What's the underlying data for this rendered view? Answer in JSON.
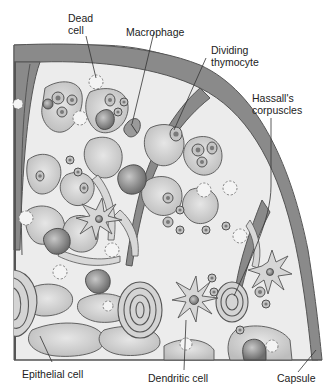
{
  "figure": {
    "colors": {
      "capsule": "#8a8a8a",
      "capsule_outline": "#555555",
      "background_tissue": "#ececec",
      "cell_fill": "#cfcfcf",
      "cell_outline": "#555555",
      "nucleus": "#8f8f8f",
      "dead_cell_outline": "#777777",
      "leader_line": "#333333",
      "label_text": "#222222"
    }
  },
  "labels": {
    "dead_cell": [
      "Dead",
      "cell"
    ],
    "macrophage": [
      "Macrophage"
    ],
    "dividing_thymocyte": [
      "Dividing",
      "thymocyte"
    ],
    "hassalls_corpuscles": [
      "Hassall's",
      "corpuscles"
    ],
    "epithelial_cell": [
      "Epithelial cell"
    ],
    "dendritic_cell": [
      "Dendritic cell"
    ],
    "capsule": [
      "Capsule"
    ]
  }
}
